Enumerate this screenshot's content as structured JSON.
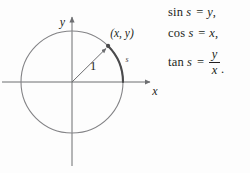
{
  "figure": {
    "type": "unit-circle-trig-diagram",
    "background_color": "#fdfdfd",
    "ink_color": "#231f20",
    "line_color": "#6d6e71",
    "arc_highlight_color": "#4a4a4c",
    "axes": {
      "x_label": "x",
      "y_label": "y",
      "origin": {
        "x": 72,
        "y": 82
      },
      "x_axis_start": 2,
      "x_axis_end": 155,
      "y_axis_top": 14,
      "y_axis_bottom": 166
    },
    "circle": {
      "center_x": 72,
      "center_y": 82,
      "radius": 51,
      "radius_label": "1",
      "point_label": "(x, y)",
      "arc_label": "s",
      "point_angle_degrees": 45
    }
  },
  "equations": {
    "sin": {
      "function": "sin",
      "argument": "s",
      "equals": "=",
      "result": "y",
      "trailing": ","
    },
    "cos": {
      "function": "cos",
      "argument": "s",
      "equals": "=",
      "result": "x",
      "trailing": ","
    },
    "tan": {
      "function": "tan",
      "argument": "s",
      "equals": "=",
      "numerator": "y",
      "denominator": "x",
      "trailing": "."
    }
  }
}
